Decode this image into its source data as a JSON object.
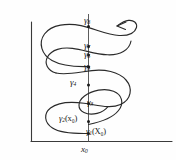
{
  "figure": {
    "type": "hand-drawn-mathematical-diagram",
    "ink_color": "#2a2a2a",
    "background_color": "#fefefe",
    "axes": {
      "vertical_axis_name": "y-axis",
      "horizontal_axis_name": "x-axis"
    },
    "labels": {
      "gamma8": {
        "symbol": "γ",
        "subscript": "8",
        "text": "γ8"
      },
      "gamma7": {
        "symbol": "γ",
        "subscript": "7",
        "text": "γ7"
      },
      "gamma6": {
        "symbol": "γ",
        "subscript": "6",
        "text": "γ6"
      },
      "gamma5": {
        "symbol": "γ",
        "subscript": "5",
        "text": "γ5"
      },
      "gamma4": {
        "symbol": "γ",
        "subscript": "4",
        "text": "γ4"
      },
      "gamma3": {
        "symbol": "γ",
        "subscript": "3",
        "text": "γ3"
      },
      "gamma2": {
        "symbol": "γ",
        "subscript": "2",
        "argument": "(x₀)",
        "text": "γ2(x₀)"
      },
      "gamma1": {
        "symbol": "γ",
        "subscript": "1",
        "argument": "(X₀)",
        "text": "γ1(X₀)"
      },
      "x0": {
        "symbol": "x",
        "subscript": "0",
        "text": "x₀"
      }
    },
    "markers": {
      "count": 8,
      "note": "curve crosses the vertical line at eight labeled iterates"
    }
  }
}
